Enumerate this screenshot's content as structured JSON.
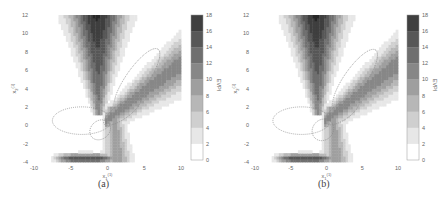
{
  "figure": {
    "panels": [
      {
        "id": "a",
        "caption": "(a)"
      },
      {
        "id": "b",
        "caption": "(b)"
      }
    ],
    "xlabel": "x",
    "xlabel_sub": "1",
    "xlabel_sup": "(1)",
    "ylabel": "x",
    "ylabel_sub": "2",
    "ylabel_sup": "(1)",
    "colorbar_label": "EVPI",
    "x_ticks": [
      "-10",
      "-5",
      "0",
      "5",
      "10"
    ],
    "y_ticks": [
      "12",
      "10",
      "8",
      "6",
      "4",
      "2",
      "0",
      "-2",
      "-4"
    ],
    "colorbar_ticks": [
      "18",
      "16",
      "14",
      "12",
      "10",
      "8",
      "6",
      "4",
      "2",
      "0"
    ]
  },
  "chart_data": [
    {
      "type": "heatmap",
      "title": "(a)",
      "xlabel": "x1(1)",
      "ylabel": "x2(1)",
      "xlim": [
        -10,
        10
      ],
      "ylim": [
        -4,
        12
      ],
      "colorbar": {
        "label": "EVPI",
        "range": [
          0,
          18
        ],
        "levels": [
          0,
          2,
          4,
          6,
          8,
          10,
          12,
          14,
          16,
          18
        ]
      },
      "description": "Filled contour of EVPI; dark ridge near x1=-1 running from y=2 up to y=12, broad band running from center toward upper right (x=10,y=6), dark band along bottom near y=-3.5 from x=-7 to x=0; dotted ellipses overlaid",
      "ellipses": [
        {
          "center": [
            -3.5,
            0.5
          ],
          "rx": 4,
          "ry": 1.5,
          "angle": 0
        },
        {
          "center": [
            4,
            5
          ],
          "rx": 5,
          "ry": 1.2,
          "angle": 55
        },
        {
          "center": [
            2,
            1.5
          ],
          "rx": 3,
          "ry": 0.8,
          "angle": 35
        },
        {
          "center": [
            -1,
            -0.5
          ],
          "rx": 1.5,
          "ry": 1,
          "angle": 40
        }
      ]
    },
    {
      "type": "heatmap",
      "title": "(b)",
      "xlabel": "x1(1)",
      "ylabel": "x2(1)",
      "xlim": [
        -10,
        10
      ],
      "ylim": [
        -4,
        12
      ],
      "colorbar": {
        "label": "EVPI",
        "range": [
          0,
          18
        ],
        "levels": [
          0,
          2,
          4,
          6,
          8,
          10,
          12,
          14,
          16,
          18
        ]
      },
      "description": "Filled contour of EVPI similar to (a), slightly different overlay ellipses",
      "ellipses": [
        {
          "center": [
            -3.5,
            0.5
          ],
          "rx": 4,
          "ry": 1.5,
          "angle": 0
        },
        {
          "center": [
            4,
            5
          ],
          "rx": 5,
          "ry": 1.2,
          "angle": 55
        },
        {
          "center": [
            2.2,
            1.5
          ],
          "rx": 2.8,
          "ry": 0.9,
          "angle": 35
        },
        {
          "center": [
            -0.5,
            -0.5
          ],
          "rx": 1.6,
          "ry": 1.1,
          "angle": 45
        }
      ]
    }
  ]
}
